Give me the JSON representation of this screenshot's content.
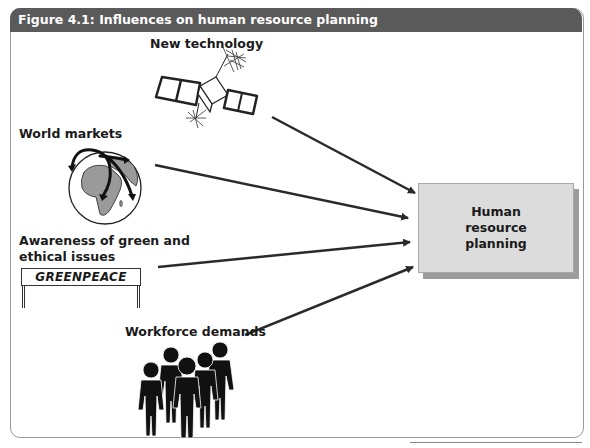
{
  "figure": {
    "title": "Figure 4.1: Influences on human resource planning"
  },
  "influences": [
    {
      "id": "new-technology",
      "label": "New technology",
      "icon": "satellite-icon"
    },
    {
      "id": "world-markets",
      "label": "World markets",
      "icon": "globe-icon"
    },
    {
      "id": "green-ethical",
      "label_line1": "Awareness of green and",
      "label_line2": "ethical issues",
      "icon": "protest-sign-icon",
      "sign_text": "GREENPEACE"
    },
    {
      "id": "workforce-demands",
      "label": "Workforce demands",
      "icon": "people-group-icon"
    }
  ],
  "target": {
    "label": "Human resource planning",
    "fill_color": "#dcdcdc",
    "shadow_color": "#9c9c9c"
  },
  "colors": {
    "titlebar": "#5a5a5a",
    "arrow": "#2a2a2a"
  }
}
